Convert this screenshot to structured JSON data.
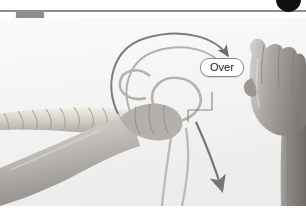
{
  "figure": {
    "kind": "instructional-photo-step",
    "step_number": "3",
    "background_color": "#ffffff",
    "photo_background_color": "#f4f4f4"
  },
  "header": {
    "rule_color": "#8d8d8d",
    "corner_dot_color": "#111111",
    "corner_dot_name": "bullet-dot"
  },
  "step_badge": {
    "label": "3",
    "background_color": "#8e8e8e",
    "text_color": "#ffffff"
  },
  "callouts": [
    {
      "id": "over",
      "label": "Over",
      "border_color": "#8a8a8a",
      "background_color": "#ffffff",
      "text_color": "#1b1b1b"
    }
  ],
  "annotations": {
    "motion_arrow_over_label": "curved-arrow-over-top",
    "motion_arrow_down_label": "arrow-down-working-end",
    "leader_line_label": "callout-leader-line",
    "arrow_color": "#6f6f6f"
  },
  "photo_elements": {
    "rope_label": "twisted-rope",
    "left_hand_label": "left-hand-holding-rope",
    "right_hand_label": "right-hand-holding-working-end",
    "forearm_label": "right-forearm",
    "loop_label": "rope-loop",
    "working_end_label": "rope-working-end"
  }
}
